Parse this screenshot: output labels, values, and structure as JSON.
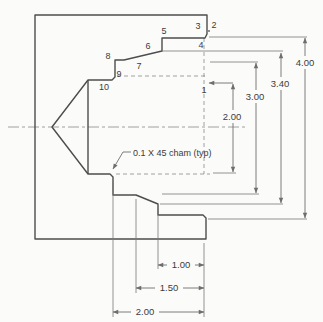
{
  "figure": {
    "title_semantic": "turned-part-toolpath-drawing",
    "note": "0.1 X 45 cham (typ)",
    "points": {
      "p1": "1",
      "p2": "2",
      "p3": "3",
      "p4": "4",
      "p5": "5",
      "p6": "6",
      "p7": "7",
      "p8": "8",
      "p9": "9",
      "p10": "10"
    },
    "diameter_dims": {
      "d400": "4.00",
      "d340": "3.40",
      "d300": "3.00",
      "d200": "2.00"
    },
    "length_dims": {
      "l100": "1.00",
      "l150": "1.50",
      "l200": "2.00"
    },
    "colors": {
      "background": "#fbfbf9",
      "profile_line": "#4d4d4d",
      "dim_line": "#6e6e6e",
      "text": "#3c3c3c"
    }
  }
}
